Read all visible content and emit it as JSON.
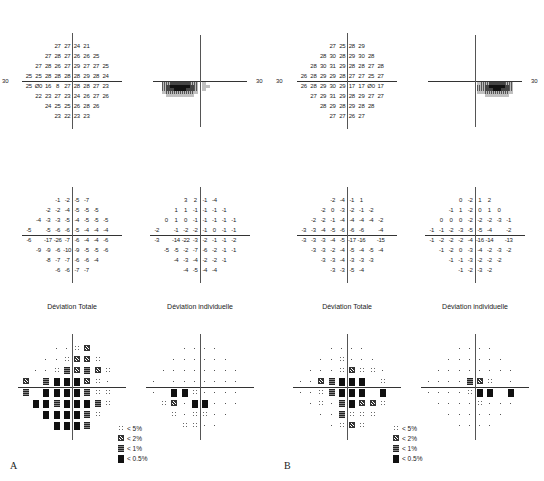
{
  "panels": [
    {
      "letter": "A",
      "axis_label": "30",
      "threshold": [
        [
          "27",
          "27",
          "24",
          "21"
        ],
        [
          "27",
          "28",
          "27",
          "26",
          "26",
          "25"
        ],
        [
          "27",
          "28",
          "26",
          "27",
          "29",
          "27",
          "27",
          "25"
        ],
        [
          "25",
          "25",
          "28",
          "28",
          "28",
          "28",
          "29",
          "28",
          "24"
        ],
        [
          "25",
          "Ø0",
          "16",
          "8",
          "27",
          "28",
          "28",
          "27",
          "23"
        ],
        [
          "22",
          "23",
          "27",
          "23",
          "24",
          "26",
          "27",
          "26"
        ],
        [
          "24",
          "25",
          "25",
          "26",
          "28",
          "26"
        ],
        [
          "23",
          "22",
          "23",
          "23"
        ]
      ],
      "total_deviation": [
        [
          "-1",
          "-2",
          "-5",
          "-7"
        ],
        [
          "-2",
          "-2",
          "-4",
          "-5",
          "-5",
          "-5"
        ],
        [
          "-4",
          "-3",
          "-3",
          "-5",
          "-4",
          "-5",
          "-5",
          "-5"
        ],
        [
          "-5",
          "",
          "-5",
          "-6",
          "-6",
          "-5",
          "-4",
          "-4",
          "-4"
        ],
        [
          "-6",
          "",
          "-17",
          "-26",
          "-7",
          "-6",
          "-4",
          "-4",
          "-6"
        ],
        [
          "-9",
          "-9",
          "-6",
          "-10",
          "-9",
          "-5",
          "-5",
          "-6"
        ],
        [
          "-8",
          "-7",
          "-7",
          "-6",
          "-6",
          "-4"
        ],
        [
          "-6",
          "-6",
          "-7",
          "-7"
        ]
      ],
      "pattern_deviation": [
        [
          "3",
          "2",
          "-1",
          "-4"
        ],
        [
          "1",
          "1",
          "-1",
          "-1",
          "-1",
          "-1"
        ],
        [
          "0",
          "1",
          "0",
          "-1",
          "-1",
          "-1",
          "-1",
          "-1"
        ],
        [
          "-2",
          "",
          "-1",
          "-2",
          "-2",
          "-1",
          "0",
          "-1",
          "-1"
        ],
        [
          "-3",
          "",
          "-14",
          "-22",
          "-3",
          "-2",
          "-1",
          "-1",
          "-2"
        ],
        [
          "-5",
          "-5",
          "-2",
          "-7",
          "-6",
          "-2",
          "-1",
          "-1"
        ],
        [
          "-4",
          "-3",
          "-4",
          "-2",
          "-2",
          "-1"
        ],
        [
          "-4",
          "-5",
          "-4",
          "-4"
        ]
      ],
      "total_deviation_title": "Déviation Totale",
      "pattern_deviation_title": "Déviation individuelle",
      "total_prob": [
        [
          ".",
          ".",
          "a",
          "b"
        ],
        [
          ".",
          ".",
          "a",
          "b",
          "b",
          "a"
        ],
        [
          ".",
          ".",
          "a",
          "c",
          "b",
          "c",
          "b",
          "a"
        ],
        [
          "b",
          "",
          "c",
          "d",
          "d",
          "d",
          "b",
          "a",
          "."
        ],
        [
          "c",
          "",
          "d",
          "d",
          "d",
          "d",
          "c",
          "a",
          "a"
        ],
        [
          "d",
          "d",
          "c",
          "d",
          "d",
          "d",
          "c",
          "a"
        ],
        [
          "d",
          "d",
          "d",
          "d",
          "c",
          "a"
        ],
        [
          "d",
          "d",
          "d",
          "c"
        ]
      ],
      "pattern_prob": [
        [
          ".",
          ".",
          ".",
          "."
        ],
        [
          ".",
          ".",
          ".",
          ".",
          ".",
          "."
        ],
        [
          ".",
          ".",
          ".",
          ".",
          ".",
          ".",
          ".",
          "."
        ],
        [
          ".",
          "",
          ".",
          ".",
          ".",
          ".",
          ".",
          ".",
          "."
        ],
        [
          ".",
          "",
          "d",
          "d",
          "a",
          ".",
          ".",
          ".",
          "."
        ],
        [
          "a",
          "b",
          ".",
          "d",
          "d",
          ".",
          ".",
          "."
        ],
        [
          "a",
          ".",
          "a",
          "a",
          ".",
          "."
        ],
        [
          "a",
          "a",
          ".",
          "."
        ]
      ]
    },
    {
      "letter": "B",
      "axis_label": "30",
      "threshold": [
        [
          "27",
          "25",
          "28",
          "29"
        ],
        [
          "28",
          "30",
          "28",
          "29",
          "30",
          "28"
        ],
        [
          "28",
          "30",
          "31",
          "29",
          "28",
          "28",
          "27",
          "28"
        ],
        [
          "26",
          "28",
          "29",
          "29",
          "28",
          "27",
          "27",
          "25",
          "27"
        ],
        [
          "26",
          "28",
          "29",
          "30",
          "29",
          "17",
          "17",
          "Ø0",
          "17"
        ],
        [
          "27",
          "29",
          "31",
          "29",
          "28",
          "29",
          "27",
          "27"
        ],
        [
          "28",
          "29",
          "28",
          "29",
          "28",
          "28"
        ],
        [
          "27",
          "27",
          "26",
          "27"
        ]
      ],
      "total_deviation": [
        [
          "-2",
          "-4",
          "-1",
          "1"
        ],
        [
          "-2",
          "0",
          "-3",
          "-2",
          "-1",
          "-2"
        ],
        [
          "-2",
          "-2",
          "-1",
          "-4",
          "-4",
          "-4",
          "-4",
          "-2"
        ],
        [
          "-3",
          "-3",
          "-4",
          "-5",
          "-6",
          "-6",
          "-6",
          "",
          "-4"
        ],
        [
          "-3",
          "-3",
          "-3",
          "-4",
          "-5",
          "-17",
          "-16",
          "",
          "-15"
        ],
        [
          "-3",
          "-3",
          "-2",
          "-4",
          "-5",
          "-4",
          "-5",
          "-4"
        ],
        [
          "-3",
          "-3",
          "-4",
          "-3",
          "-3",
          "-3"
        ],
        [
          "-3",
          "-3",
          "-5",
          "-4"
        ]
      ],
      "pattern_deviation": [
        [
          "0",
          "-2",
          "1",
          "2"
        ],
        [
          "-1",
          "1",
          "-2",
          "0",
          "1",
          "0"
        ],
        [
          "0",
          "0",
          "0",
          "-2",
          "-2",
          "-2",
          "-3",
          "-1"
        ],
        [
          "-1",
          "-1",
          "-2",
          "-3",
          "-5",
          "-5",
          "-4",
          "",
          "-2"
        ],
        [
          "-1",
          "-2",
          "-2",
          "-2",
          "-4",
          "-16",
          "-14",
          "",
          "-13"
        ],
        [
          "-1",
          "-2",
          "0",
          "-3",
          "-4",
          "-2",
          "-3",
          "-2"
        ],
        [
          "-1",
          "-1",
          "-3",
          "-2",
          "-2",
          "-2"
        ],
        [
          "-1",
          "-2",
          "-3",
          "-2"
        ]
      ],
      "total_deviation_title": "Déviation Totale",
      "pattern_deviation_title": "Déviation individuelle",
      "total_prob": [
        [
          ".",
          ".",
          ".",
          "."
        ],
        [
          ".",
          ".",
          "a",
          ".",
          ".",
          "."
        ],
        [
          ".",
          ".",
          ".",
          "a",
          "b",
          "a",
          "a",
          "."
        ],
        [
          ".",
          ".",
          "b",
          "c",
          "d",
          "d",
          "d",
          "",
          "a"
        ],
        [
          ".",
          ".",
          "a",
          "c",
          "d",
          "d",
          "d",
          "",
          "d"
        ],
        [
          ".",
          "a",
          ".",
          "c",
          "d",
          "b",
          "b",
          "a"
        ],
        [
          ".",
          ".",
          "c",
          "a",
          "a",
          "a"
        ],
        [
          ".",
          "a",
          "b",
          "a"
        ]
      ],
      "pattern_prob": [
        [
          ".",
          ".",
          ".",
          "."
        ],
        [
          ".",
          ".",
          ".",
          ".",
          ".",
          "."
        ],
        [
          ".",
          ".",
          ".",
          ".",
          ".",
          ".",
          ".",
          "."
        ],
        [
          ".",
          ".",
          ".",
          ".",
          "c",
          "b",
          "a",
          "",
          "."
        ],
        [
          ".",
          ".",
          ".",
          ".",
          "a",
          "d",
          "d",
          "",
          "d"
        ],
        [
          ".",
          ".",
          ".",
          ".",
          "a",
          ".",
          ".",
          "."
        ],
        [
          ".",
          ".",
          ".",
          ".",
          ".",
          "."
        ],
        [
          ".",
          ".",
          ".",
          "."
        ]
      ]
    }
  ],
  "legend": {
    "items": [
      {
        "code": "a",
        "label": "< 5%"
      },
      {
        "code": "b",
        "label": "< 2%"
      },
      {
        "code": "c",
        "label": "< 1%"
      },
      {
        "code": "d",
        "label": "< 0.5%"
      }
    ]
  }
}
